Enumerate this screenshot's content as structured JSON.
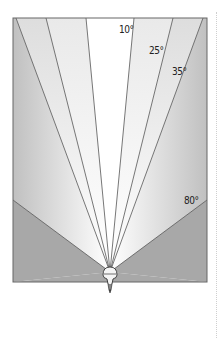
{
  "diagram": {
    "title": "",
    "angle_labels": [
      {
        "text": "10°",
        "x": 119,
        "y": 24
      },
      {
        "text": "25°",
        "x": 149,
        "y": 45
      },
      {
        "text": "35°",
        "x": 172,
        "y": 66
      },
      {
        "text": "80°",
        "x": 184,
        "y": 195
      }
    ],
    "colors": {
      "shade": "#a8a8a8",
      "line": "#555555",
      "frame": "#666666"
    }
  }
}
